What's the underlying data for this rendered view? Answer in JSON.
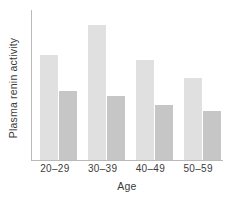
{
  "chart_data": {
    "type": "bar",
    "title": "",
    "subtitle": "",
    "xlabel": "Age",
    "ylabel": "Plasma renin activity",
    "categories": [
      "20–29",
      "30–39",
      "40–49",
      "50–59"
    ],
    "series": [
      {
        "name": "series-1-light",
        "color": "#e0e0e0",
        "values": [
          0.7,
          0.9,
          0.67,
          0.55
        ]
      },
      {
        "name": "series-2-dark",
        "color": "#c6c6c6",
        "values": [
          0.46,
          0.43,
          0.37,
          0.33
        ]
      }
    ],
    "ylim": [
      0,
      1
    ],
    "y_tick_labels": [],
    "grid": false,
    "legend": false,
    "legend_position": "none",
    "axis_color": "#b9b9b9",
    "annotations": []
  },
  "figure": {
    "background": "#ffffff",
    "axes": {
      "left_spine_visible": true,
      "bottom_spine_visible": true,
      "top_spine_visible": false,
      "right_spine_visible": false,
      "y_ticks_visible": false,
      "x_ticks_visible": false
    }
  }
}
